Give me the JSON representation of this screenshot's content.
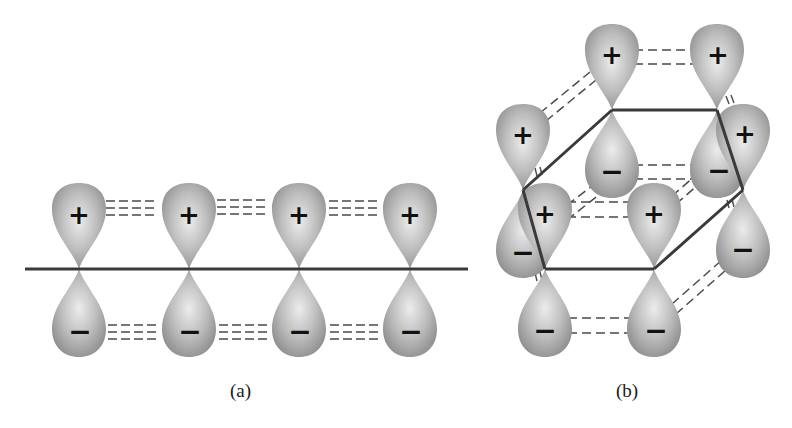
{
  "figure": {
    "panels": [
      {
        "id": "a",
        "caption": "(a)",
        "description": "Four parallel p orbitals on a linear chain with side-by-side overlap",
        "orbitals": [
          {
            "x": 79,
            "top_sign": "+",
            "bottom_sign": "−"
          },
          {
            "x": 189,
            "top_sign": "+",
            "bottom_sign": "−"
          },
          {
            "x": 299,
            "top_sign": "+",
            "bottom_sign": "−"
          },
          {
            "x": 410,
            "top_sign": "+",
            "bottom_sign": "−"
          }
        ]
      },
      {
        "id": "b",
        "caption": "(b)",
        "description": "Six p orbitals on a hexagonal ring (benzene) with continuous overlap",
        "orbitals": [
          {
            "name": "back-left",
            "x": 612,
            "y": 110,
            "top_sign": "+",
            "bottom_sign": "−"
          },
          {
            "name": "back-right",
            "x": 717,
            "y": 110,
            "top_sign": "+",
            "bottom_sign": "−"
          },
          {
            "name": "right",
            "x": 743,
            "y": 190,
            "top_sign": "+",
            "bottom_sign": "−"
          },
          {
            "name": "front-right",
            "x": 654,
            "y": 269,
            "top_sign": "+",
            "bottom_sign": "−"
          },
          {
            "name": "front-left",
            "x": 545,
            "y": 269,
            "top_sign": "+",
            "bottom_sign": "−"
          },
          {
            "name": "left",
            "x": 523,
            "y": 190,
            "top_sign": "+",
            "bottom_sign": "−"
          }
        ]
      }
    ],
    "colors": {
      "lobe_light": "#e6e6e6",
      "lobe_dark": "#8c8c8c",
      "bond": "#3a3a3a",
      "dash": "#4a4a4a",
      "sign": "#111111"
    }
  }
}
